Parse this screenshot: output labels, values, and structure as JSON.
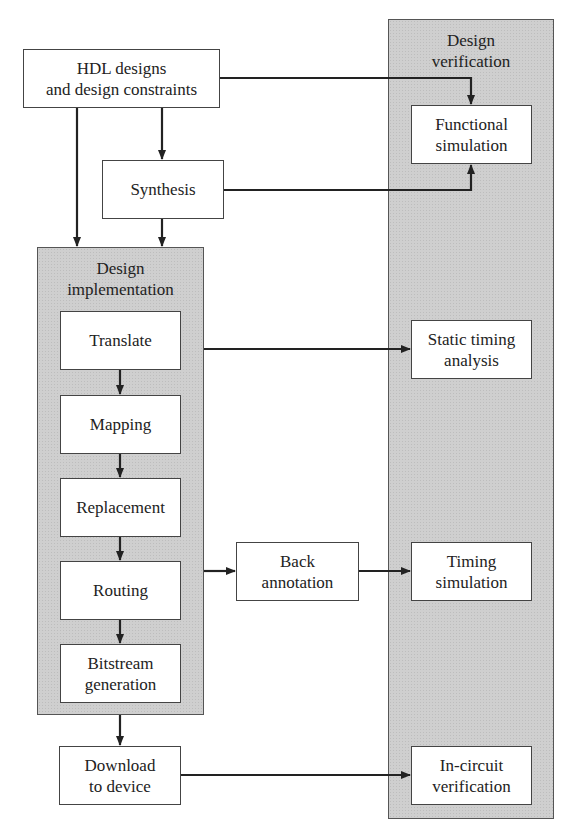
{
  "diagram": {
    "panels": {
      "verification": {
        "title": "Design\nverification"
      },
      "implementation": {
        "title": "Design\nimplementation"
      }
    },
    "nodes": {
      "hdl": "HDL designs\nand design constraints",
      "synthesis": "Synthesis",
      "translate": "Translate",
      "mapping": "Mapping",
      "replacement": "Replacement",
      "routing": "Routing",
      "bitstream": "Bitstream\ngeneration",
      "download": "Download\nto device",
      "back_annotation": "Back\nannotation",
      "functional_sim": "Functional\nsimulation",
      "static_timing": "Static timing\nanalysis",
      "timing_sim": "Timing\nsimulation",
      "in_circuit": "In-circuit\nverification"
    },
    "edges": [
      {
        "from": "hdl",
        "to": "functional_sim"
      },
      {
        "from": "hdl",
        "to": "synthesis"
      },
      {
        "from": "hdl",
        "to": "implementation"
      },
      {
        "from": "synthesis",
        "to": "functional_sim"
      },
      {
        "from": "synthesis",
        "to": "implementation"
      },
      {
        "from": "translate",
        "to": "mapping"
      },
      {
        "from": "mapping",
        "to": "replacement"
      },
      {
        "from": "replacement",
        "to": "routing"
      },
      {
        "from": "routing",
        "to": "bitstream"
      },
      {
        "from": "implementation",
        "to": "static_timing"
      },
      {
        "from": "implementation",
        "to": "back_annotation"
      },
      {
        "from": "back_annotation",
        "to": "timing_sim"
      },
      {
        "from": "implementation",
        "to": "download"
      },
      {
        "from": "download",
        "to": "in_circuit"
      }
    ],
    "colors": {
      "panel_fill": "#cfcfcf",
      "line": "#222222",
      "box_fill": "#ffffff"
    }
  }
}
